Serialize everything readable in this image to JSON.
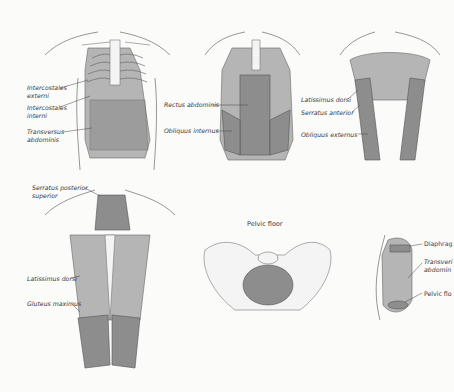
{
  "figures": [
    {
      "id": "anterior-ribcage",
      "labels": [
        "Intercostales externi",
        "Intercostales interni",
        "Transversus abdominis"
      ]
    },
    {
      "id": "anterior-abdominals",
      "labels": [
        "Rectus abdominis",
        "Obliquus internus"
      ]
    },
    {
      "id": "anterior-superficial",
      "labels": [
        "Latissimus dorsi",
        "Serratus anterior",
        "Obliquus externus"
      ]
    },
    {
      "id": "posterior-back",
      "labels": [
        "Serratus posterior superior",
        "Latissimus dorsi",
        "Gluteus maximus"
      ]
    },
    {
      "id": "pelvic-floor",
      "title": "Pelvic floor"
    },
    {
      "id": "lateral-trunk",
      "labels": [
        "Diaphrag",
        "Transversi",
        "abdomin",
        "Pelvic flo"
      ]
    }
  ],
  "labels": {
    "ic_ext_1": "Intercostales",
    "ic_ext_2": "externi",
    "ic_int_1": "Intercostales",
    "ic_int_2": "interni",
    "ta_1": "Transversus",
    "ta_2": "abdominis",
    "rectus": "Rectus abdominis",
    "obl_int": "Obliquus internus",
    "lat_front": "Latissimus dorsi",
    "serr_ant": "Serratus anterior",
    "obl_ext": "Obliquus externus",
    "serr_post_1": "Serratus posterior",
    "serr_post_2": "superior",
    "lat_back": "Latissimus dorsi",
    "glut": "Gluteus maximus",
    "pelvic_title": "Pelvic floor",
    "diaph": "Diaphrag",
    "trans_1": "Transveri",
    "trans_2": "abdomin",
    "pelvic_fl": "Pelvic flo"
  }
}
